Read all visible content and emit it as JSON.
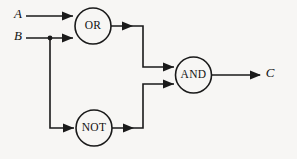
{
  "diagram": {
    "background_color": "#f7f6f4",
    "line_color": "#1a1a1a",
    "inputs": [
      {
        "id": "input-a",
        "label": "A"
      },
      {
        "id": "input-b",
        "label": "B"
      }
    ],
    "outputs": [
      {
        "id": "output-c",
        "label": "C"
      }
    ],
    "gates": [
      {
        "id": "gate-or",
        "label": "OR",
        "shape": "circle",
        "cx": 93,
        "cy": 26,
        "r": 18
      },
      {
        "id": "gate-and",
        "label": "AND",
        "shape": "circle",
        "cx": 193.5,
        "cy": 75,
        "r": 18
      },
      {
        "id": "gate-not",
        "label": "NOT",
        "shape": "circle",
        "cx": 94,
        "cy": 128,
        "r": 18
      }
    ],
    "connections": [
      {
        "id": "wire-a-to-or",
        "from": "A",
        "to": "OR",
        "path": "M26,16 L73,16"
      },
      {
        "id": "wire-b-to-or",
        "from": "B",
        "to": "OR",
        "path": "M26,38 L73,38"
      },
      {
        "id": "wire-b-to-not",
        "from": "B",
        "to": "NOT",
        "path": "M50,38 L50,128 L74,128"
      },
      {
        "id": "wire-or-to-and",
        "from": "OR",
        "to": "AND",
        "path": "M111,26 L143,26 L143,67 L174,67"
      },
      {
        "id": "wire-not-to-and",
        "from": "NOT",
        "to": "AND",
        "path": "M112,128 L143,128 L143,84 L174,84"
      },
      {
        "id": "wire-and-to-c",
        "from": "AND",
        "to": "C",
        "path": "M212,75 L260,75"
      }
    ],
    "junctions": [
      {
        "id": "junction-b",
        "cx": 50,
        "cy": 38,
        "r": 2.4
      }
    ]
  }
}
